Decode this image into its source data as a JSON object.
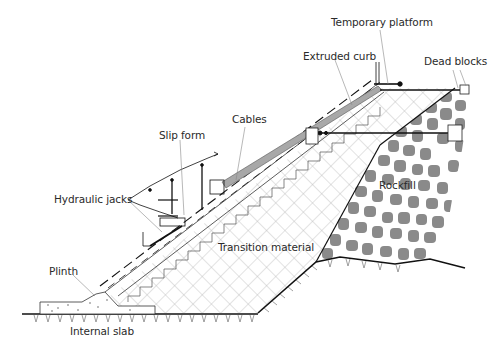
{
  "diagram": {
    "type": "cross-section",
    "labels": {
      "temporary_platform": "Temporary platform",
      "extruded_curb": "Extruded curb",
      "dead_blocks": "Dead blocks",
      "cables": "Cables",
      "slip_form": "Slip form",
      "hydraulic_jacks": "Hydraulic jacks",
      "rockfill": "Rockfill",
      "transition_material": "Transition material",
      "plinth": "Plinth",
      "internal_slab": "Internal slab"
    },
    "colors": {
      "line": "#111111",
      "hatch": "#b5b5b5",
      "rock": "#8a8a8a",
      "curb": "#a8a8a8",
      "leader": "#888888"
    }
  }
}
